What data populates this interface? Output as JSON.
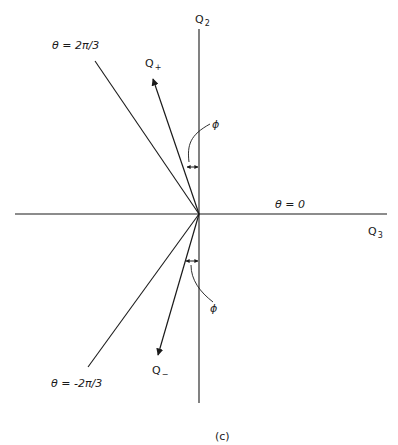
{
  "diagram": {
    "caption": "(c)",
    "axes": {
      "vertical_label": "Q",
      "vertical_sub": "2",
      "horizontal_label": "Q",
      "horizontal_sub": "3"
    },
    "lines": {
      "theta_pos": "θ = 2π/3",
      "theta_zero": "θ = 0",
      "theta_neg": "θ = -2π/3"
    },
    "vectors": {
      "q_plus_label": "Q",
      "q_plus_sub": "+",
      "q_minus_label": "Q",
      "q_minus_sub": "−"
    },
    "angle_labels": {
      "upper_phi": "ϕ",
      "lower_phi": "ϕ"
    },
    "stroke_color": "#1a1a1a",
    "background_color": "#ffffff"
  }
}
